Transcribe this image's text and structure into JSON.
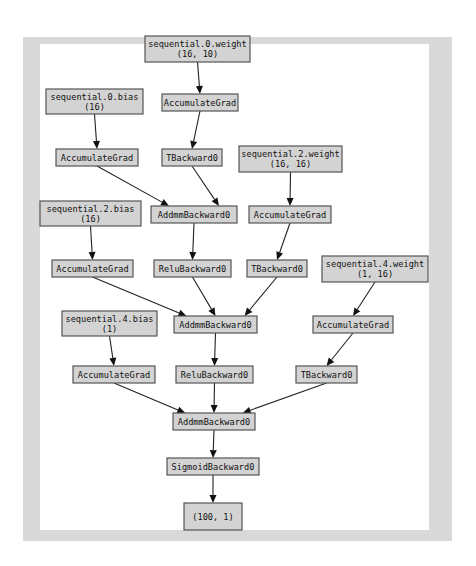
{
  "diagram": {
    "nodes": [
      {
        "id": "w0",
        "lines": [
          "sequential.0.weight",
          "(16, 10)"
        ],
        "kind": "parameter"
      },
      {
        "id": "acc_w0",
        "lines": [
          "AccumulateGrad"
        ],
        "kind": "op"
      },
      {
        "id": "b0",
        "lines": [
          "sequential.0.bias",
          "(16)"
        ],
        "kind": "parameter"
      },
      {
        "id": "acc_b0",
        "lines": [
          "AccumulateGrad"
        ],
        "kind": "op"
      },
      {
        "id": "t0",
        "lines": [
          "TBackward0"
        ],
        "kind": "op"
      },
      {
        "id": "w2",
        "lines": [
          "sequential.2.weight",
          "(16, 16)"
        ],
        "kind": "parameter"
      },
      {
        "id": "addmm0",
        "lines": [
          "AddmmBackward0"
        ],
        "kind": "op"
      },
      {
        "id": "acc_w2",
        "lines": [
          "AccumulateGrad"
        ],
        "kind": "op"
      },
      {
        "id": "b2",
        "lines": [
          "sequential.2.bias",
          "(16)"
        ],
        "kind": "parameter"
      },
      {
        "id": "acc_b2",
        "lines": [
          "AccumulateGrad"
        ],
        "kind": "op"
      },
      {
        "id": "relu0",
        "lines": [
          "ReluBackward0"
        ],
        "kind": "op"
      },
      {
        "id": "t2",
        "lines": [
          "TBackward0"
        ],
        "kind": "op"
      },
      {
        "id": "w4",
        "lines": [
          "sequential.4.weight",
          "(1, 16)"
        ],
        "kind": "parameter"
      },
      {
        "id": "addmm2",
        "lines": [
          "AddmmBackward0"
        ],
        "kind": "op"
      },
      {
        "id": "b4",
        "lines": [
          "sequential.4.bias",
          "(1)"
        ],
        "kind": "parameter"
      },
      {
        "id": "acc_w4",
        "lines": [
          "AccumulateGrad"
        ],
        "kind": "op"
      },
      {
        "id": "acc_b4",
        "lines": [
          "AccumulateGrad"
        ],
        "kind": "op"
      },
      {
        "id": "relu2",
        "lines": [
          "ReluBackward0"
        ],
        "kind": "op"
      },
      {
        "id": "t4",
        "lines": [
          "TBackward0"
        ],
        "kind": "op"
      },
      {
        "id": "addmm4",
        "lines": [
          "AddmmBackward0"
        ],
        "kind": "op"
      },
      {
        "id": "sigmoid",
        "lines": [
          "SigmoidBackward0"
        ],
        "kind": "op"
      },
      {
        "id": "out",
        "lines": [
          "(100, 1)"
        ],
        "kind": "output"
      }
    ],
    "edges": [
      [
        "w0",
        "acc_w0"
      ],
      [
        "acc_w0",
        "t0"
      ],
      [
        "b0",
        "acc_b0"
      ],
      [
        "acc_b0",
        "addmm0"
      ],
      [
        "t0",
        "addmm0"
      ],
      [
        "w2",
        "acc_w2"
      ],
      [
        "acc_w2",
        "t2"
      ],
      [
        "b2",
        "acc_b2"
      ],
      [
        "addmm0",
        "relu0"
      ],
      [
        "acc_b2",
        "addmm2"
      ],
      [
        "relu0",
        "addmm2"
      ],
      [
        "t2",
        "addmm2"
      ],
      [
        "w4",
        "acc_w4"
      ],
      [
        "acc_w4",
        "t4"
      ],
      [
        "b4",
        "acc_b4"
      ],
      [
        "addmm2",
        "relu2"
      ],
      [
        "acc_b4",
        "addmm4"
      ],
      [
        "relu2",
        "addmm4"
      ],
      [
        "t4",
        "addmm4"
      ],
      [
        "addmm4",
        "sigmoid"
      ],
      [
        "sigmoid",
        "out"
      ]
    ]
  }
}
